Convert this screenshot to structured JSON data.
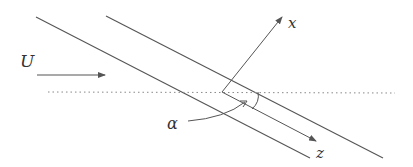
{
  "diagram": {
    "labels": {
      "flow_velocity": "U",
      "x_axis": "x",
      "z_axis": "z",
      "angle": "α"
    },
    "colors": {
      "stroke": "#555555",
      "text": "#333333",
      "dotted": "#888888",
      "background": "#ffffff"
    },
    "elements": [
      "two parallel inclined lines (channel walls)",
      "horizontal dotted reference line",
      "flow arrow U pointing right",
      "x axis arrow perpendicular to walls",
      "z axis arrow parallel to walls",
      "angle alpha between dotted line and z axis"
    ]
  }
}
